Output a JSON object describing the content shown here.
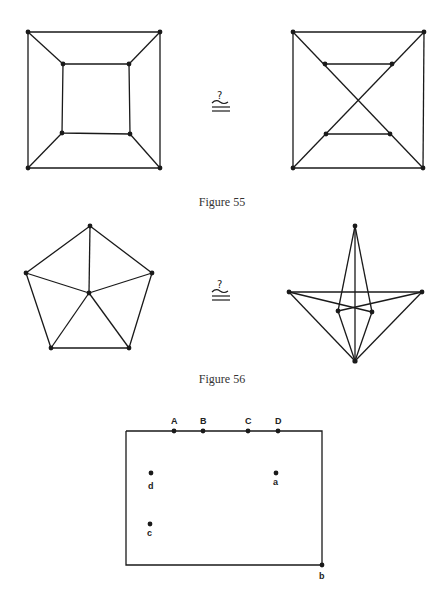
{
  "figures": [
    {
      "caption": "Figure 55",
      "relation_symbol": "?≅"
    },
    {
      "caption": "Figure 56",
      "relation_symbol": "?≅"
    },
    {
      "caption": "",
      "labels": {
        "top": [
          "A",
          "B",
          "C",
          "D"
        ],
        "inner": [
          "d",
          "a",
          "c"
        ],
        "corner": "b"
      }
    }
  ],
  "colors": {
    "ink": "#1a1a1a",
    "background": "#ffffff"
  }
}
